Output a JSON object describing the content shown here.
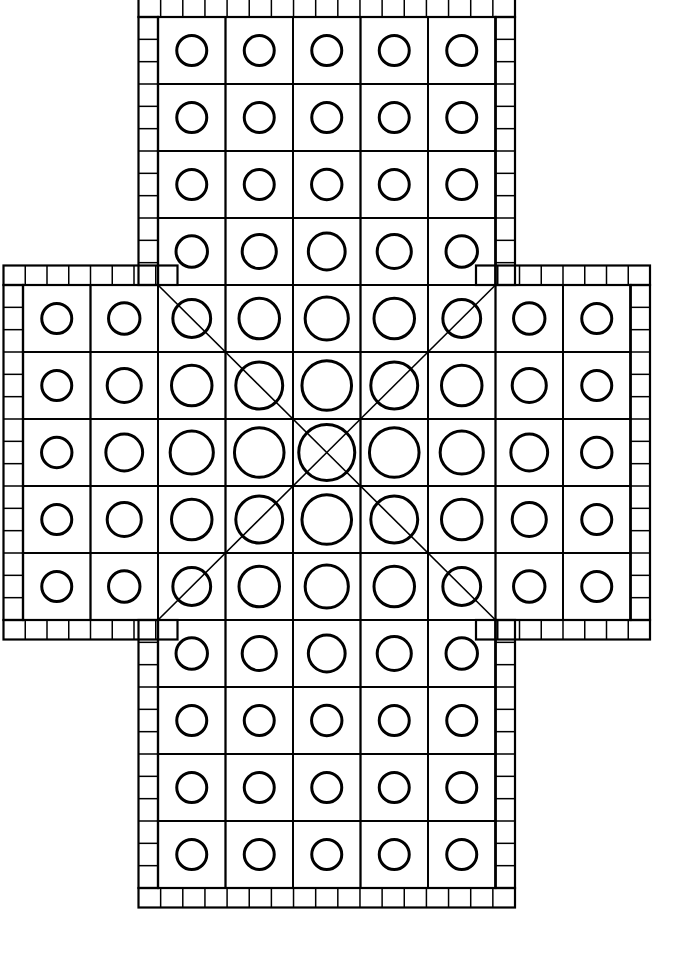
{
  "diagram": {
    "type": "line-art-game-board",
    "colors": {
      "background": "#ffffff",
      "stroke": "#000000",
      "cell_stroke": "#000000",
      "circle_stroke": "#000000",
      "diagonal_stroke": "#000000"
    },
    "canvas": {
      "width": 677,
      "height": 969
    },
    "geometry": {
      "cell_w": 67.5,
      "cell_h": 67.0,
      "origin_x": 23.0,
      "origin_y": 17.0,
      "cols": 9,
      "rows": 13,
      "border_band": 19.5,
      "ticks_per_cell": 3,
      "grid_stroke_width": 1.8,
      "outline_stroke_width": 2.2,
      "tick_stroke_width": 1.5,
      "circle_stroke_width": 3.0,
      "diagonal_stroke_width": 1.6
    },
    "shape": {
      "vertical_band_cols": [
        2,
        3,
        4,
        5,
        6
      ],
      "horizontal_band_rows": [
        4,
        5,
        6,
        7,
        8
      ],
      "top_arm_rows": [
        0,
        1,
        2,
        3
      ],
      "bottom_arm_rows": [
        9,
        10,
        11,
        12
      ],
      "left_arm_cols": [
        0,
        1
      ],
      "right_arm_cols": [
        7,
        8
      ],
      "centre_cell": {
        "col": 4,
        "row": 6
      }
    },
    "circles": {
      "note": "Circle radius shrinks with Chebyshev-like distance from the centre cell.",
      "radius_centre": 28.0,
      "radius_step": 3.2,
      "radius_min": 15.0,
      "radius_max": 30.0
    },
    "diagonals": [
      {
        "name": "diagonal-up-left",
        "from": [
          4,
          6
        ],
        "to": [
          2,
          4
        ]
      },
      {
        "name": "diagonal-up-right",
        "from": [
          4,
          6
        ],
        "to": [
          6,
          4
        ]
      },
      {
        "name": "diagonal-down-left",
        "from": [
          4,
          6
        ],
        "to": [
          2,
          8
        ]
      },
      {
        "name": "diagonal-down-right",
        "from": [
          4,
          6
        ],
        "to": [
          6,
          8
        ]
      }
    ],
    "counts": {
      "total_cells": 72,
      "total_circles": 72,
      "top_arm_cells": 20,
      "bottom_arm_cells": 20,
      "middle_band_cells": 45,
      "diagonal_lines": 4
    },
    "legend": {
      "cell_label": "board-cell",
      "circle_label": "cell-circle",
      "border_label": "tick-border",
      "diagonal_label": "centre-diagonal"
    }
  }
}
